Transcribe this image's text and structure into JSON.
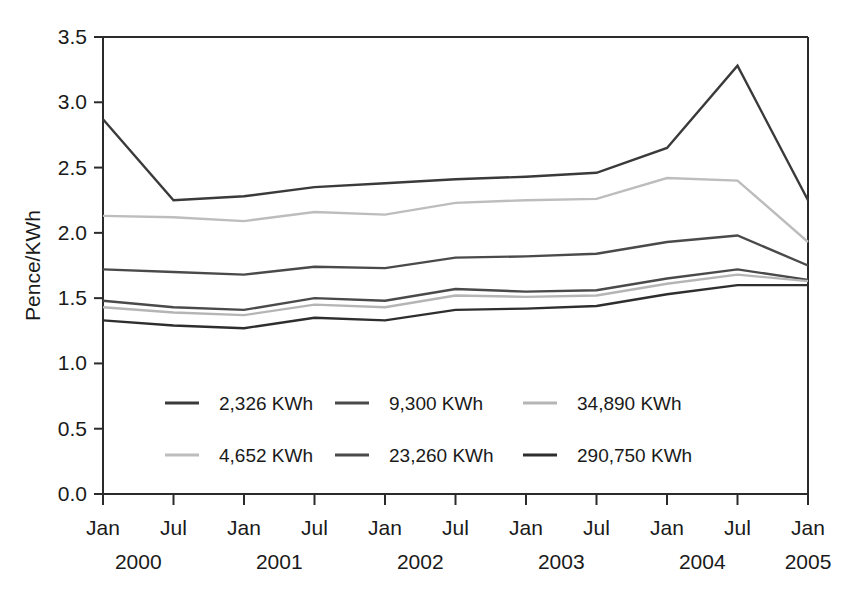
{
  "chart_data": {
    "type": "line",
    "title": "",
    "xlabel": "",
    "ylabel": "Pence/KWh",
    "ylim": [
      0.0,
      3.5
    ],
    "yticks": [
      "0.0",
      "0.5",
      "1.0",
      "1.5",
      "2.0",
      "2.5",
      "3.0",
      "3.5"
    ],
    "ytick_values": [
      0.0,
      0.5,
      1.0,
      1.5,
      2.0,
      2.5,
      3.0,
      3.5
    ],
    "grid": false,
    "legend_position": "inside-lower-center",
    "x": [
      "Jan 2000",
      "Jul 2000",
      "Jan 2001",
      "Jul 2001",
      "Jan 2002",
      "Jul 2002",
      "Jan 2003",
      "Jul 2003",
      "Jan 2004",
      "Jul 2004",
      "Jan 2005"
    ],
    "xtick_months": [
      "Jan",
      "Jul",
      "Jan",
      "Jul",
      "Jan",
      "Jul",
      "Jan",
      "Jul",
      "Jan",
      "Jul",
      "Jan"
    ],
    "xtick_years": [
      {
        "label": "2000",
        "index": 0
      },
      {
        "label": "2001",
        "index": 2
      },
      {
        "label": "2002",
        "index": 4
      },
      {
        "label": "2003",
        "index": 6
      },
      {
        "label": "2004",
        "index": 8
      },
      {
        "label": "2005",
        "index": 10
      }
    ],
    "series": [
      {
        "name": "2,326 KWh",
        "color": "#3a3a3a",
        "width": 2.4,
        "values": [
          2.87,
          2.25,
          2.28,
          2.35,
          2.38,
          2.41,
          2.43,
          2.46,
          2.65,
          3.28,
          2.25
        ]
      },
      {
        "name": "4,652 KWh",
        "color": "#bdbdbd",
        "width": 2.4,
        "values": [
          2.13,
          2.12,
          2.09,
          2.16,
          2.14,
          2.23,
          2.25,
          2.26,
          2.42,
          2.4,
          1.93
        ]
      },
      {
        "name": "9,300 KWh",
        "color": "#4a4a4a",
        "width": 2.4,
        "values": [
          1.72,
          1.7,
          1.68,
          1.74,
          1.73,
          1.81,
          1.82,
          1.84,
          1.93,
          1.98,
          1.75
        ]
      },
      {
        "name": "23,260 KWh",
        "color": "#4a4a4a",
        "width": 2.4,
        "values": [
          1.48,
          1.43,
          1.41,
          1.5,
          1.48,
          1.57,
          1.55,
          1.56,
          1.65,
          1.72,
          1.64
        ]
      },
      {
        "name": "34,890 KWh",
        "color": "#b5b5b5",
        "width": 2.4,
        "values": [
          1.43,
          1.39,
          1.37,
          1.45,
          1.43,
          1.52,
          1.51,
          1.52,
          1.61,
          1.68,
          1.63
        ]
      },
      {
        "name": "290,750 KWh",
        "color": "#2e2e2e",
        "width": 2.4,
        "values": [
          1.33,
          1.29,
          1.27,
          1.35,
          1.33,
          1.41,
          1.42,
          1.44,
          1.53,
          1.6,
          1.6
        ]
      }
    ]
  },
  "legend": {
    "entries": [
      {
        "label": "2,326 KWh",
        "color": "#3a3a3a",
        "col": 0,
        "row": 0
      },
      {
        "label": "9,300 KWh",
        "color": "#4a4a4a",
        "col": 1,
        "row": 0
      },
      {
        "label": "34,890 KWh",
        "color": "#b5b5b5",
        "col": 2,
        "row": 0
      },
      {
        "label": "4,652 KWh",
        "color": "#bdbdbd",
        "col": 0,
        "row": 1
      },
      {
        "label": "23,260 KWh",
        "color": "#4a4a4a",
        "col": 1,
        "row": 1
      },
      {
        "label": "290,750 KWh",
        "color": "#2e2e2e",
        "col": 2,
        "row": 1
      }
    ]
  },
  "axis": {
    "y_title": "Pence/KWh",
    "y_labels": [
      "3.5",
      "3.0",
      "2.5",
      "2.0",
      "1.5",
      "1.0",
      "0.5",
      "0.0"
    ]
  },
  "colors": {
    "axis": "#2b2b2b",
    "text": "#1a1a1a",
    "background": "#ffffff"
  }
}
